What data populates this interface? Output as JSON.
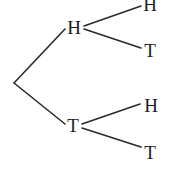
{
  "diagram": {
    "type": "binary-tree",
    "background_color": "#ffffff",
    "stroke_color": "#2a2a2a",
    "text_color": "#1c1c1c",
    "nodes": {
      "root": {
        "label": "",
        "x": 14,
        "y": 83
      },
      "level1": [
        {
          "id": "h",
          "label": "H",
          "x": 74,
          "y": 28
        },
        {
          "id": "t",
          "label": "T",
          "x": 73,
          "y": 126
        }
      ],
      "level2": [
        {
          "id": "hh",
          "label": "H",
          "parent": "h",
          "x": 150,
          "y": 5
        },
        {
          "id": "ht",
          "label": "T",
          "parent": "h",
          "x": 150,
          "y": 51
        },
        {
          "id": "th",
          "label": "H",
          "parent": "t",
          "x": 151,
          "y": 106
        },
        {
          "id": "tt",
          "label": "T",
          "parent": "t",
          "x": 150,
          "y": 153
        }
      ]
    },
    "edges": [
      {
        "id": "root-h",
        "x1": 14,
        "y1": 83,
        "x2": 65,
        "y2": 29
      },
      {
        "id": "root-t",
        "x1": 14,
        "y1": 83,
        "x2": 65,
        "y2": 124
      },
      {
        "id": "h-hh",
        "x1": 84,
        "y1": 26,
        "x2": 141,
        "y2": 6
      },
      {
        "id": "h-ht",
        "x1": 84,
        "y1": 29,
        "x2": 141,
        "y2": 48
      },
      {
        "id": "t-th",
        "x1": 82,
        "y1": 124,
        "x2": 140,
        "y2": 104
      },
      {
        "id": "t-tt",
        "x1": 82,
        "y1": 128,
        "x2": 141,
        "y2": 147
      }
    ]
  },
  "chart_data": {
    "type": "diagram",
    "categories": [
      "HH",
      "HT",
      "TH",
      "TT"
    ],
    "values": [
      1,
      1,
      1,
      1
    ]
  }
}
